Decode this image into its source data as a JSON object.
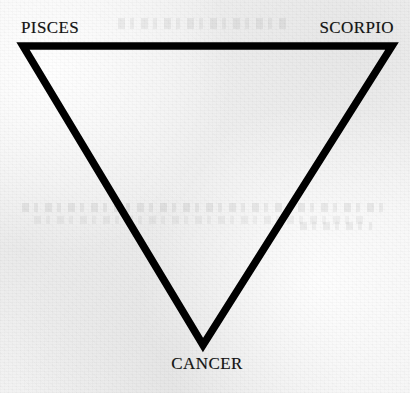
{
  "figure": {
    "background_color": "#f1f1f1",
    "ink_color": "#000000",
    "shape_name": "downward-pointing-triangle"
  },
  "diagram": {
    "type": "triangle",
    "orientation": "point-down",
    "fill": "none",
    "stroke_color": "#000000",
    "vertices": [
      {
        "id": "top-left",
        "label": "PISCES",
        "x": 23,
        "y": 46
      },
      {
        "id": "top-right",
        "label": "SCORPIO",
        "x": 392,
        "y": 46
      },
      {
        "id": "bottom-apex",
        "label": "CANCER",
        "x": 203,
        "y": 345
      }
    ]
  },
  "labels": {
    "top_left": "PISCES",
    "top_right": "SCORPIO",
    "bottom": "CANCER"
  }
}
